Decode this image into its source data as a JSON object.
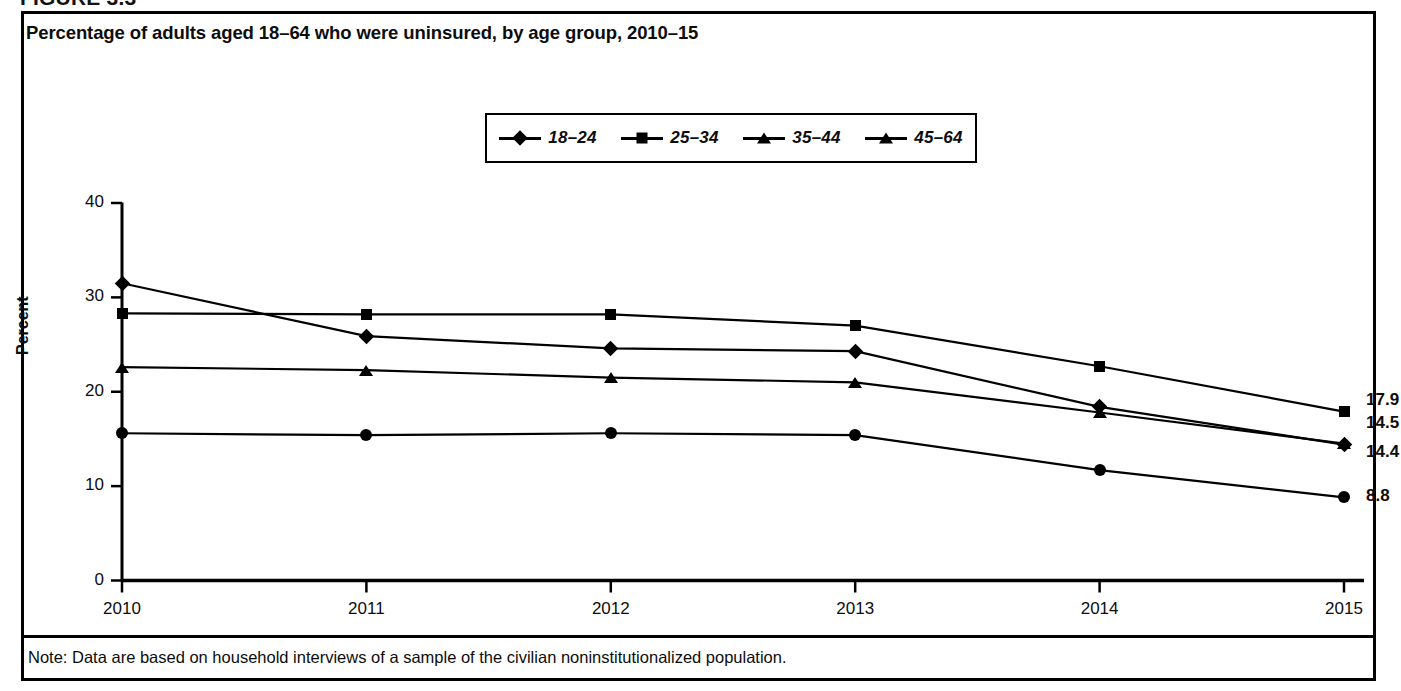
{
  "figure": {
    "number_label": "FIGURE 3.3",
    "title": "Percentage of adults aged 18–64 who were uninsured, by age group, 2010–15",
    "note": "Note: Data are based on household interviews of a sample of the civilian noninstitutionalized population."
  },
  "colors": {
    "ink": "#000000",
    "background": "#ffffff"
  },
  "legend": {
    "position": "top-center",
    "entries": [
      {
        "label": "18–24",
        "marker": "diamond"
      },
      {
        "label": "25–34",
        "marker": "square"
      },
      {
        "label": "35–44",
        "marker": "triangle"
      },
      {
        "label": "45–64",
        "marker": "triangle"
      }
    ]
  },
  "axes": {
    "y_label": "Percent",
    "y_ticks": [
      "0",
      "10",
      "20",
      "30",
      "40"
    ],
    "x_ticks": [
      "2010",
      "2011",
      "2012",
      "2013",
      "2014",
      "2015"
    ]
  },
  "end_labels": [
    {
      "value": "17.9",
      "series": "25–34"
    },
    {
      "value": "14.5",
      "series": "35–44"
    },
    {
      "value": "14.4",
      "series": "18–24"
    },
    {
      "value": "8.8",
      "series": "45–64"
    }
  ],
  "chart_data": {
    "type": "line",
    "title": "Percentage of adults aged 18–64 who were uninsured, by age group, 2010–15",
    "xlabel": "",
    "ylabel": "Percent",
    "ylim": [
      0,
      40
    ],
    "ytick_step": 10,
    "grid": false,
    "legend_position": "top-center",
    "x": [
      "2010",
      "2011",
      "2012",
      "2013",
      "2014",
      "2015"
    ],
    "categories": [
      "2010",
      "2011",
      "2012",
      "2013",
      "2014",
      "2015"
    ],
    "series": [
      {
        "name": "18–24",
        "marker": "diamond",
        "values": [
          31.5,
          25.9,
          24.6,
          24.3,
          18.4,
          14.4
        ],
        "end_label": "14.4"
      },
      {
        "name": "25–34",
        "marker": "square",
        "values": [
          28.3,
          28.2,
          28.2,
          27.0,
          22.7,
          17.9
        ],
        "end_label": "17.9"
      },
      {
        "name": "35–44",
        "marker": "triangle",
        "values": [
          22.6,
          22.3,
          21.5,
          21.0,
          17.8,
          14.5
        ],
        "end_label": "14.5"
      },
      {
        "name": "45–64",
        "marker": "circle",
        "values": [
          15.6,
          15.4,
          15.6,
          15.4,
          11.7,
          8.8
        ],
        "end_label": "8.8"
      }
    ],
    "annotations": [
      "Note: Data are based on household interviews of a sample of the civilian noninstitutionalized population."
    ]
  }
}
